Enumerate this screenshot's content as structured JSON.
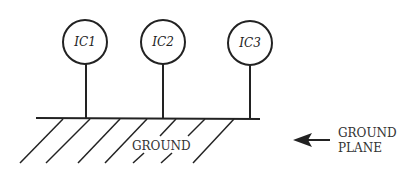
{
  "diagram": {
    "ics": [
      {
        "label": "IC1",
        "cx": 85,
        "cy": 42
      },
      {
        "label": "IC2",
        "cx": 163,
        "cy": 42
      },
      {
        "label": "IC3",
        "cx": 250,
        "cy": 43
      }
    ],
    "ground_label": "GROUND",
    "plane_label_line1": "GROUND",
    "plane_label_line2": "PLANE",
    "colors": {
      "ink": "#222222",
      "background": "#ffffff"
    }
  }
}
